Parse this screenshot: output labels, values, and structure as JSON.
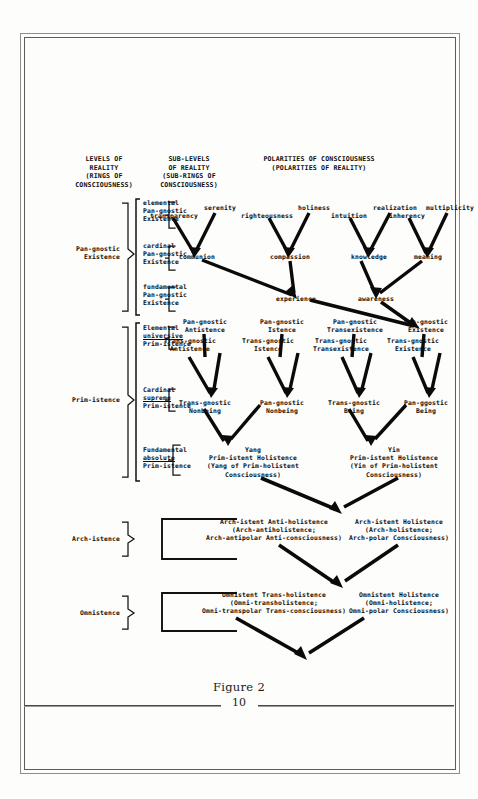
{
  "page": {
    "caption": "Figure 2",
    "folio": "10"
  },
  "headers": {
    "col1": [
      "LEVELS OF",
      "REALITY",
      "(RINGS OF",
      "CONSCIOUSNESS)"
    ],
    "col2": [
      "SUB-LEVELS",
      "OF REALITY",
      "(SUB-RINGS OF",
      "CONSCIOUSNESS)"
    ],
    "col3": [
      "POLARITIES OF CONSCIOUSNESS",
      "(POLARITIES OF REALITY)"
    ]
  },
  "levels": [
    {
      "id": "pan-gnostic-existence",
      "lines": [
        "Pan-gnostic",
        "Existence"
      ]
    },
    {
      "id": "prim-istence",
      "lines": [
        "Prim-istence"
      ]
    },
    {
      "id": "arch-istence",
      "lines": [
        "Arch-istence"
      ]
    },
    {
      "id": "omnistence",
      "lines": [
        "Omnistence"
      ]
    }
  ],
  "sublevels": [
    {
      "id": "elemental-pan-gnostic-existence",
      "lines": [
        "elemental",
        "Pan-gnostic",
        "Existence"
      ],
      "underline": []
    },
    {
      "id": "cardinal-pan-gnostic-existence",
      "lines": [
        "cardinal",
        "Pan-gnostic",
        "Existence"
      ],
      "underline": []
    },
    {
      "id": "fundamental-pan-gnostic-existence",
      "lines": [
        "fundamental",
        "Pan-gnostic",
        "Existence"
      ],
      "underline": []
    },
    {
      "id": "elemental-universive-prim-istence",
      "lines": [
        "Elemental",
        "universive",
        "Prim-istence"
      ],
      "underline": [
        1
      ]
    },
    {
      "id": "cardinal-supreme-prim-istence",
      "lines": [
        "Cardinal",
        "supreme",
        "Prim-istence"
      ],
      "underline": [
        1
      ]
    },
    {
      "id": "fundamental-absolute-prim-istence",
      "lines": [
        "Fundamental",
        "absolute",
        "Prim-istence"
      ],
      "underline": [
        1
      ]
    }
  ],
  "polarities": {
    "row_tier1": [
      {
        "id": "transparency",
        "label": "transparency"
      },
      {
        "id": "serenity",
        "label": "serenity"
      },
      {
        "id": "righteousness",
        "label": "righteousness"
      },
      {
        "id": "holiness",
        "label": "holiness"
      },
      {
        "id": "intuition",
        "label": "intuition"
      },
      {
        "id": "realization",
        "label": "realization"
      },
      {
        "id": "inherency",
        "label": "inherency"
      },
      {
        "id": "multiplicity",
        "label": "multiplicity"
      }
    ],
    "row_tier2": [
      {
        "id": "communion",
        "label": "communion"
      },
      {
        "id": "compassion",
        "label": "compassion"
      },
      {
        "id": "knowledge",
        "label": "knowledge"
      },
      {
        "id": "meaning",
        "label": "meaning"
      }
    ],
    "row_tier3": [
      {
        "id": "experience",
        "label": "experience"
      },
      {
        "id": "awareness",
        "label": "awareness"
      }
    ],
    "row_prim_upper": [
      {
        "id": "pan-gnostic-antistence",
        "lines": [
          "Pan-gnostic",
          "Antistence"
        ]
      },
      {
        "id": "pan-gnostic-istence",
        "lines": [
          "Pan-gnostic",
          "Istence"
        ]
      },
      {
        "id": "pan-gnostic-transexistence",
        "lines": [
          "Pan-gnostic",
          "Transexistence"
        ]
      },
      {
        "id": "pan-gnostic-existence-node",
        "lines": [
          "Pan-gnostic",
          "Existence"
        ]
      }
    ],
    "row_prim_lower": [
      {
        "id": "trans-gnostic-antistence",
        "lines": [
          "Trans-gnostic",
          "Antistence"
        ]
      },
      {
        "id": "trans-gnostic-istence",
        "lines": [
          "Trans-gnostic",
          "Istence"
        ]
      },
      {
        "id": "trans-gnostic-transexistence",
        "lines": [
          "Trans-gnostic",
          "Transexistence"
        ]
      },
      {
        "id": "trans-gnostic-existence",
        "lines": [
          "Trans-gnostic",
          "Existence"
        ]
      }
    ],
    "row_being": [
      {
        "id": "trans-gnostic-nonbeing",
        "lines": [
          "Trans-gnostic",
          "Nonbeing"
        ]
      },
      {
        "id": "pan-gnostic-nonbeing",
        "lines": [
          "Pan-gnostic",
          "Nonbeing"
        ]
      },
      {
        "id": "trans-gnostic-being",
        "lines": [
          "Trans-gnostic",
          "Being"
        ]
      },
      {
        "id": "pan-ggostic-being",
        "lines": [
          "Pan-ggostic",
          "Being"
        ]
      }
    ],
    "row_holistence": [
      {
        "id": "yang-prim-istent-holistence",
        "lines": [
          "Yang",
          "Prim-istent Holistence",
          "(Yang of Prim-holistent",
          "Consciousness)"
        ]
      },
      {
        "id": "yin-prim-istent-holistence",
        "lines": [
          "Yin",
          "Prim-istent Holistence",
          "(Yin of Prim-holistent",
          "Consciousness)"
        ]
      }
    ],
    "row_arch": [
      {
        "id": "arch-istent-anti-holistence",
        "lines": [
          "Arch-istent Anti-holistence",
          "(Arch-antiholistence;",
          "Arch-antipolar Anti-consciousness)"
        ]
      },
      {
        "id": "arch-istent-holistence",
        "lines": [
          "Arch-istent Holistence",
          "(Arch-holistence;",
          "Arch-polar Consciousness)"
        ]
      }
    ],
    "row_omni": [
      {
        "id": "omnistent-trans-holistence",
        "lines": [
          "Omnistent Trans-holistence",
          "(Omni-transholistence;",
          "Omni-transpolar Trans-consciousness)"
        ]
      },
      {
        "id": "omnistent-holistence",
        "lines": [
          "Omnistent Holistence",
          "(Omni-holistence;",
          "Omni-polar Consciousness)"
        ]
      }
    ]
  },
  "colors": {
    "ink": "#0d0d0d",
    "paper": "#fdfdfc",
    "rule": "#4a4a4a"
  }
}
